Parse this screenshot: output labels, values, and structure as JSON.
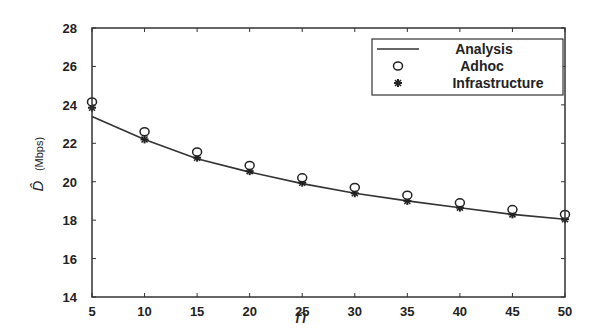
{
  "chart_data": {
    "type": "line",
    "title": "",
    "xlabel": "n",
    "ylabel": "D̂ (Mbps)",
    "ylabel_symbol": "D̂",
    "ylabel_unit": "(Mbps)",
    "xlim": [
      5,
      50
    ],
    "ylim": [
      14,
      28
    ],
    "x_ticks": [
      5,
      10,
      15,
      20,
      25,
      30,
      35,
      40,
      45,
      50
    ],
    "y_ticks": [
      14,
      16,
      18,
      20,
      22,
      24,
      26,
      28
    ],
    "grid": false,
    "legend_position": "upper right",
    "x": [
      5,
      10,
      15,
      20,
      25,
      30,
      35,
      40,
      45,
      50
    ],
    "series": [
      {
        "name": "Analysis",
        "style": "solid line",
        "values": [
          23.4,
          22.2,
          21.2,
          20.5,
          19.9,
          19.4,
          19.0,
          18.65,
          18.3,
          18.05
        ]
      },
      {
        "name": "Adhoc",
        "style": "open circle markers",
        "values": [
          24.15,
          22.6,
          21.55,
          20.85,
          20.2,
          19.7,
          19.3,
          18.9,
          18.55,
          18.3
        ]
      },
      {
        "name": "Infrastructure",
        "style": "star markers",
        "values": [
          23.85,
          22.2,
          21.25,
          20.55,
          19.95,
          19.4,
          19.0,
          18.65,
          18.3,
          18.05
        ]
      }
    ]
  },
  "colors": {
    "line": "#333333",
    "axis": "#333333",
    "background": "#ffffff"
  }
}
